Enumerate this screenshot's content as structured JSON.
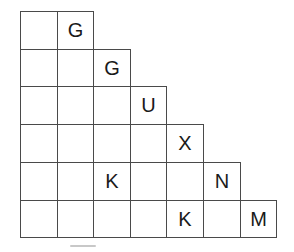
{
  "grid": {
    "origin": {
      "x": 20,
      "y": 11
    },
    "cell_width": 36.6,
    "cell_height": 37.7,
    "border_color": "#4a4a4a",
    "text_color": "#1a1a1a",
    "rows": [
      [
        "",
        "G"
      ],
      [
        "",
        "",
        "G"
      ],
      [
        "",
        "",
        "",
        "U"
      ],
      [
        "",
        "",
        "",
        "",
        "X"
      ],
      [
        "",
        "",
        "K",
        "",
        "",
        "N"
      ],
      [
        "",
        "",
        "",
        "",
        "K",
        "",
        "M"
      ]
    ]
  }
}
